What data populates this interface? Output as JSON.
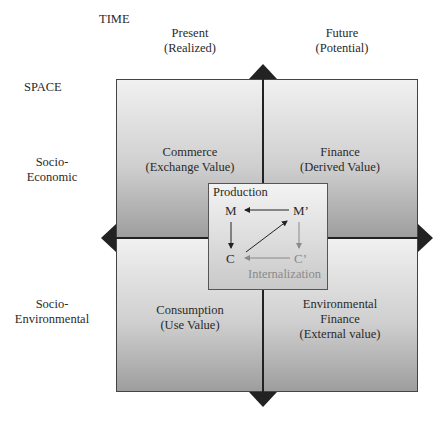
{
  "axes": {
    "time_label": "TIME",
    "space_label": "SPACE",
    "columns": [
      {
        "line1": "Present",
        "line2": "(Realized)"
      },
      {
        "line1": "Future",
        "line2": "(Potential)"
      }
    ],
    "rows": [
      {
        "line1": "Socio-",
        "line2": "Economic"
      },
      {
        "line1": "Socio-",
        "line2": "Environmental"
      }
    ]
  },
  "quadrants": {
    "top_left": {
      "line1": "Commerce",
      "line2": "(Exchange Value)"
    },
    "top_right": {
      "line1": "Finance",
      "line2": "(Derived Value)"
    },
    "bottom_left": {
      "line1": "Consumption",
      "line2": "(Use Value)"
    },
    "bottom_right": {
      "line1": "Environmental",
      "line2": "Finance",
      "line3": "(External value)"
    }
  },
  "center": {
    "title": "Production",
    "nodes": {
      "m": "M",
      "m_prime": "M’",
      "c": "C",
      "c_prime": "C’"
    },
    "footer": "Internalization"
  },
  "colors": {
    "arrow_dark": "#222222",
    "arrow_light": "#8a8a8a",
    "gradient_top": "#f1f1f1",
    "gradient_bottom": "#9d9d9d"
  }
}
